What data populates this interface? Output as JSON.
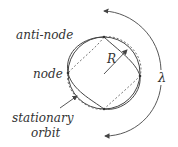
{
  "diagram": {
    "labels": {
      "anti_node": "anti-node",
      "node": "node",
      "stationary_orbit_line1": "stationary",
      "stationary_orbit_line2": "orbit",
      "radius": "R",
      "wavelength": "λ"
    },
    "nodes_count": 4,
    "colors": {
      "stroke": "#444444",
      "dashed": "#777777",
      "text": "#333333"
    }
  }
}
